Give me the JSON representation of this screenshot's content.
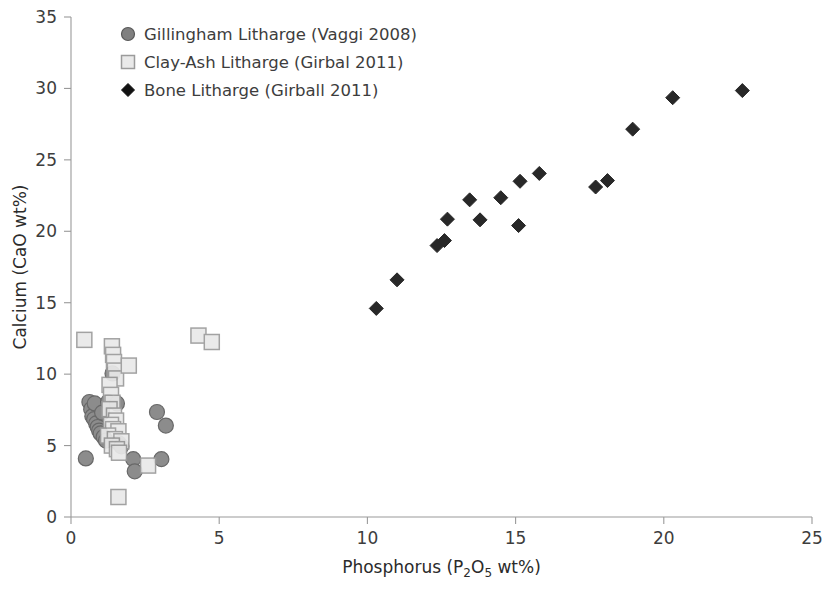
{
  "chart_data": {
    "type": "scatter",
    "title": "",
    "xlabel": "Phosphorus (P2O5 wt%)",
    "ylabel": "Calcium (CaO wt%)",
    "xlabel_parts": {
      "pre": "Phosphorus (P",
      "sub1": "2",
      "mid": "O",
      "sub2": "5",
      "post": " wt%)"
    },
    "xlim": [
      0,
      25
    ],
    "ylim": [
      0,
      35
    ],
    "xticks": [
      0,
      5,
      10,
      15,
      20,
      25
    ],
    "yticks": [
      0,
      5,
      10,
      15,
      20,
      25,
      30,
      35
    ],
    "grid": false,
    "legend_position": "top-left",
    "series": [
      {
        "name": "Gillingham Litharge (Vaggi 2008)",
        "marker": "circle",
        "fill": "#808080",
        "stroke": "#585858",
        "points": [
          [
            0.5,
            4.1
          ],
          [
            0.62,
            8.05
          ],
          [
            0.68,
            7.55
          ],
          [
            0.72,
            7.05
          ],
          [
            0.78,
            6.85
          ],
          [
            0.8,
            7.95
          ],
          [
            0.85,
            6.55
          ],
          [
            0.9,
            6.3
          ],
          [
            0.95,
            6.05
          ],
          [
            1.0,
            5.85
          ],
          [
            1.05,
            7.3
          ],
          [
            1.1,
            5.6
          ],
          [
            1.18,
            5.35
          ],
          [
            1.25,
            8.05
          ],
          [
            1.4,
            10.05
          ],
          [
            1.55,
            7.95
          ],
          [
            1.62,
            5.15
          ],
          [
            1.7,
            4.95
          ],
          [
            2.1,
            4.05
          ],
          [
            2.15,
            3.2
          ],
          [
            2.9,
            7.35
          ],
          [
            3.05,
            4.05
          ],
          [
            3.2,
            6.4
          ]
        ]
      },
      {
        "name": "Clay-Ash Litharge (Girbal 2011)",
        "marker": "square",
        "fill": "#e9e9e9",
        "stroke": "#9b9b9b",
        "points": [
          [
            0.45,
            12.4
          ],
          [
            1.38,
            11.95
          ],
          [
            1.42,
            11.35
          ],
          [
            1.45,
            10.85
          ],
          [
            1.48,
            10.25
          ],
          [
            1.52,
            9.7
          ],
          [
            1.3,
            9.25
          ],
          [
            1.95,
            10.6
          ],
          [
            1.35,
            8.55
          ],
          [
            1.4,
            8.0
          ],
          [
            1.3,
            7.55
          ],
          [
            1.45,
            7.1
          ],
          [
            1.52,
            6.75
          ],
          [
            1.35,
            6.45
          ],
          [
            1.42,
            6.15
          ],
          [
            1.6,
            6.0
          ],
          [
            1.25,
            5.7
          ],
          [
            1.48,
            5.45
          ],
          [
            1.7,
            5.3
          ],
          [
            1.38,
            5.0
          ],
          [
            1.55,
            4.75
          ],
          [
            1.62,
            4.5
          ],
          [
            2.6,
            3.6
          ],
          [
            1.6,
            1.4
          ],
          [
            4.3,
            12.7
          ],
          [
            4.75,
            12.25
          ]
        ]
      },
      {
        "name": "Bone Litharge (Girball 2011)",
        "marker": "diamond",
        "fill": "#111111",
        "stroke": "#111111",
        "points": [
          [
            10.3,
            14.6
          ],
          [
            11.0,
            16.6
          ],
          [
            12.35,
            19.0
          ],
          [
            12.6,
            19.35
          ],
          [
            12.7,
            20.85
          ],
          [
            13.45,
            22.2
          ],
          [
            13.8,
            20.8
          ],
          [
            14.5,
            22.35
          ],
          [
            15.1,
            20.4
          ],
          [
            15.15,
            23.5
          ],
          [
            15.8,
            24.05
          ],
          [
            17.7,
            23.1
          ],
          [
            18.1,
            23.55
          ],
          [
            18.95,
            27.15
          ],
          [
            20.3,
            29.35
          ],
          [
            22.65,
            29.85
          ]
        ]
      }
    ]
  },
  "legend": {
    "entries": [
      {
        "label": "Gillingham Litharge (Vaggi 2008)",
        "marker": "circle"
      },
      {
        "label": "Clay-Ash Litharge (Girbal 2011)",
        "marker": "square"
      },
      {
        "label": "Bone Litharge (Girball 2011)",
        "marker": "diamond"
      }
    ]
  },
  "colors": {
    "circle_fill": "#808080",
    "circle_stroke": "#585858",
    "square_fill": "#e9e9e9",
    "square_stroke": "#9b9b9b",
    "diamond_fill": "#111111",
    "axis": "#9a9a9a",
    "text": "#3d3d3d",
    "background": "#ffffff"
  }
}
